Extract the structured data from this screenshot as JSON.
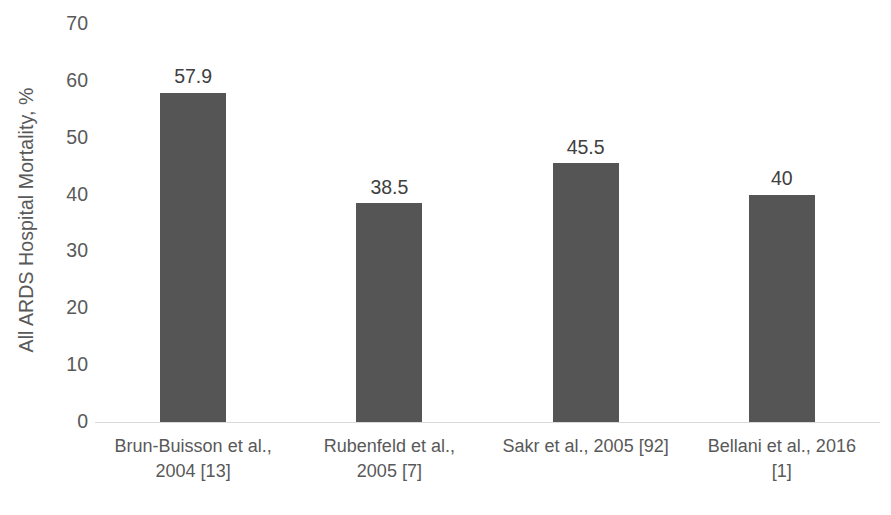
{
  "chart_data": {
    "type": "bar",
    "title": "",
    "subtitle": "",
    "xlabel": "",
    "ylabel": "All ARDS Hospital Mortality, %",
    "ylim": [
      0,
      70
    ],
    "ytick_step": 10,
    "yticks": [
      "70",
      "60",
      "50",
      "40",
      "30",
      "20",
      "10",
      "0"
    ],
    "grid": false,
    "legend": false,
    "bar_color": "#555555",
    "axis_line_color": "#d9d9d9",
    "tick_label_color": "#595959",
    "data_label_color": "#404040",
    "categories": [
      "Brun-Buisson et al., 2004 [13]",
      "Rubenfeld et al., 2005 [7]",
      "Sakr et al., 2005 [92]",
      "Bellani et al., 2016 [1]"
    ],
    "category_lines": [
      [
        "Brun-Buisson et al.,",
        "2004 [13]"
      ],
      [
        "Rubenfeld et al.,",
        "2005 [7]"
      ],
      [
        "Sakr et al., 2005 [92]",
        ""
      ],
      [
        "Bellani et al., 2016",
        "[1]"
      ]
    ],
    "values": [
      57.9,
      38.5,
      45.5,
      40
    ],
    "data_labels": [
      "57.9",
      "38.5",
      "45.5",
      "40"
    ]
  }
}
